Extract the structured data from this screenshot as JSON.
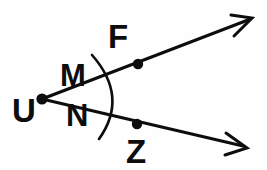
{
  "figure": {
    "background_color": "#fefefe",
    "ink_color": "#0d0d0d",
    "width": 267,
    "height": 170,
    "vertex": {
      "name": "U",
      "label": "U",
      "x": 42,
      "y": 99,
      "label_x": 24,
      "label_y": 118,
      "font_size": 30
    },
    "rays": [
      {
        "name": "ray-u-f",
        "label": "UF",
        "from_x": 42,
        "from_y": 99,
        "to_x": 248,
        "to_y": 20,
        "stroke_width": 3.0,
        "arrow_tip_x": 252,
        "arrow_tip_y": 18,
        "arrow_barb_1_x": 231,
        "arrow_barb_1_y": 15,
        "arrow_barb_2_x": 234,
        "arrow_barb_2_y": 36
      },
      {
        "name": "ray-u-z",
        "label": "UZ",
        "from_x": 42,
        "from_y": 99,
        "to_x": 243,
        "to_y": 146,
        "stroke_width": 3.0,
        "arrow_tip_x": 247,
        "arrow_tip_y": 148,
        "arrow_barb_1_x": 226,
        "arrow_barb_1_y": 133,
        "arrow_barb_2_x": 225,
        "arrow_barb_2_y": 155
      }
    ],
    "points": [
      {
        "name": "point-f",
        "label": "F",
        "x": 138,
        "y": 64,
        "radius": 5.2,
        "label_x": 109,
        "label_y": 47,
        "font_size": 30
      },
      {
        "name": "point-z",
        "label": "Z",
        "x": 137,
        "y": 124,
        "radius": 5.2,
        "label_x": 127,
        "label_y": 162,
        "font_size": 30
      }
    ],
    "arc": {
      "name": "angle-arc",
      "description": "arc sweeping across the interior of the angle at vertex U",
      "start_x": 92,
      "start_y": 55,
      "end_x": 99,
      "end_y": 139,
      "control_x": 129,
      "control_y": 97,
      "stroke_width": 2.6
    },
    "interior_labels": [
      {
        "name": "label-m",
        "label": "M",
        "label_x": 62,
        "label_y": 85,
        "font_size": 30
      },
      {
        "name": "label-n",
        "label": "N",
        "label_x": 68,
        "label_y": 125,
        "font_size": 30
      }
    ]
  }
}
